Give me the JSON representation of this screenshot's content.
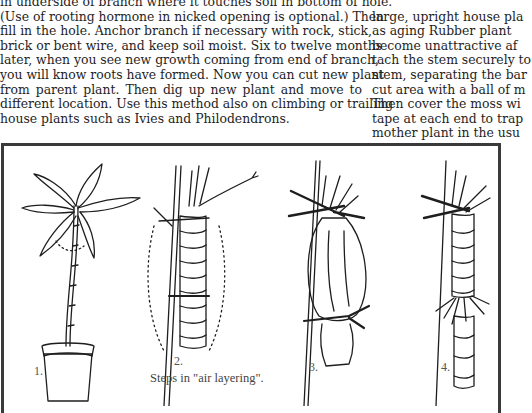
{
  "left_column": {
    "lines": [
      "in underside of branch where it touches soil in bottom of hole.",
      "(Use of rooting hormone in nicked opening is optional.) Then",
      "fill in the hole.  Anchor branch if necessary with rock, stick,",
      "brick or bent wire, and keep soil moist.  Six to twelve months",
      "later, when you see new growth coming from end of branch,",
      "you will know roots have formed.  Now you can cut new plant",
      "from parent plant.  Then dig up new plant and move to",
      "different location. Use this method also on climbing or trailing",
      "house plants such as Ivies and Philodendrons."
    ]
  },
  "right_column": {
    "lines": [
      "",
      "large, upright house pla",
      "as aging Rubber plant",
      "become unattractive af",
      "tach the stem securely to",
      "stem, separating the bar",
      "cut area with a ball of m",
      "Then cover the moss wi",
      "tape at each end to trap",
      "mother plant in the usu"
    ]
  },
  "figure": {
    "step_labels": [
      "1.",
      "2.",
      "3.",
      "4."
    ],
    "caption": "Steps in \"air layering\".",
    "illustrations": [
      "potted-plant-with-leaves",
      "stem-wrapped-with-moss-tied-to-stake",
      "moss-wrapped-in-plastic-tied-at-ends",
      "rooted-stem-ready-to-cut"
    ],
    "colors": {
      "ink": "#1e1e1e",
      "frame": "#3a3a3a",
      "paper": "#ffffff"
    }
  }
}
